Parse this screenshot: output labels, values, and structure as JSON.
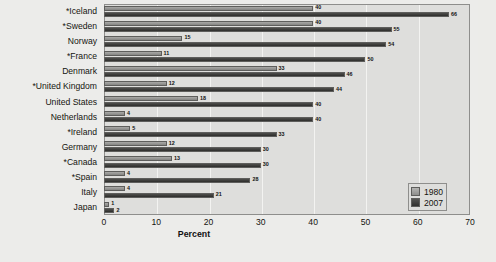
{
  "chart_data": {
    "type": "bar",
    "orientation": "horizontal",
    "title": "",
    "xlabel": "Percent",
    "ylabel": "",
    "xlim": [
      0,
      70
    ],
    "xticks": [
      0,
      10,
      20,
      30,
      40,
      50,
      60,
      70
    ],
    "grid": true,
    "legend_position": "bottom-right",
    "categories": [
      "*Iceland",
      "*Sweden",
      "Norway",
      "*France",
      "Denmark",
      "*United Kingdom",
      "United States",
      "Netherlands",
      "*Ireland",
      "Germany",
      "*Canada",
      "*Spain",
      "Italy",
      "Japan"
    ],
    "series": [
      {
        "name": "1980",
        "color": "#9a9a98",
        "values": [
          40,
          40,
          15,
          11,
          33,
          12,
          18,
          4,
          5,
          12,
          13,
          4,
          4,
          1
        ]
      },
      {
        "name": "2007",
        "color": "#3a3a38",
        "values": [
          66,
          55,
          54,
          50,
          46,
          44,
          40,
          40,
          33,
          30,
          30,
          28,
          21,
          2
        ]
      }
    ]
  },
  "legend": {
    "items": [
      {
        "label": "1980"
      },
      {
        "label": "2007"
      }
    ]
  },
  "axis": {
    "x_title": "Percent"
  }
}
